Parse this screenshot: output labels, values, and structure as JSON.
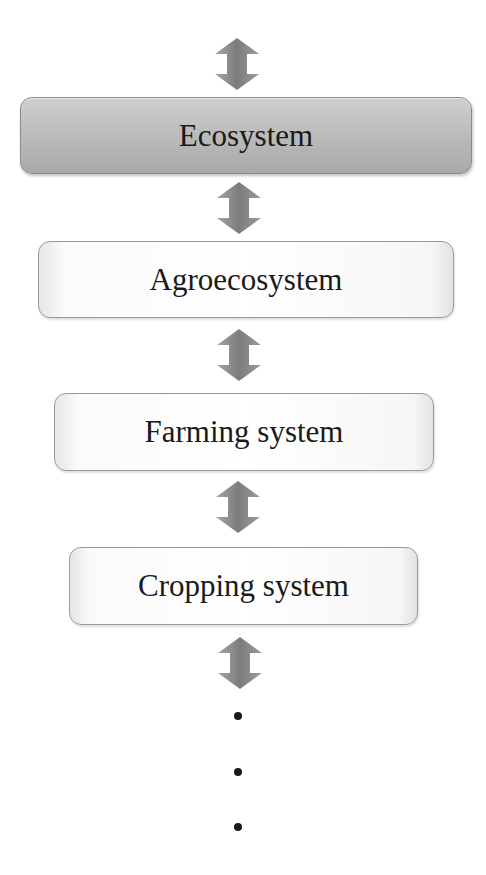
{
  "diagram": {
    "type": "hierarchy",
    "orientation": "vertical",
    "levels": [
      {
        "label": "Ecosystem",
        "highlighted": true
      },
      {
        "label": "Agroecosystem",
        "highlighted": false
      },
      {
        "label": "Farming system",
        "highlighted": false
      },
      {
        "label": "Cropping system",
        "highlighted": false
      }
    ],
    "connector": "bidirectional-arrow-icon",
    "continuation": "vertical-ellipsis",
    "colors": {
      "highlight_box": "#b8b8b8",
      "box_border": "#9a9a9a",
      "arrow": "#8c8c8c",
      "text": "#1a1a1a"
    }
  }
}
